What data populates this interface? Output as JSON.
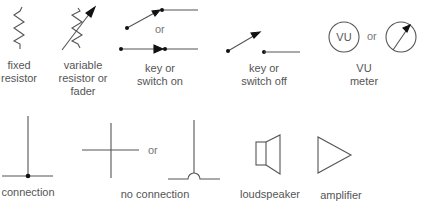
{
  "symbols": [
    {
      "id": "fixed-resistor",
      "label_line1": "fixed",
      "label_line2": "resistor"
    },
    {
      "id": "variable-resistor",
      "label_line1": "variable",
      "label_line2": "resistor or",
      "label_line3": "fader"
    },
    {
      "id": "switch-on",
      "label_line1": "key or",
      "label_line2": "switch on"
    },
    {
      "id": "switch-off",
      "label_line1": "key or",
      "label_line2": "switch off"
    },
    {
      "id": "vu-meter",
      "label_line1": "VU",
      "label_line2": "meter",
      "glyph_text": "VU"
    },
    {
      "id": "connection",
      "label_line1": "connection"
    },
    {
      "id": "no-connection",
      "label_line1": "no connection"
    },
    {
      "id": "loudspeaker",
      "label_line1": "loudspeaker"
    },
    {
      "id": "amplifier",
      "label_line1": "amplifier"
    }
  ],
  "or_text": "or",
  "colors": {
    "stroke": "#555555",
    "fill": "#222222",
    "text": "#555555"
  }
}
